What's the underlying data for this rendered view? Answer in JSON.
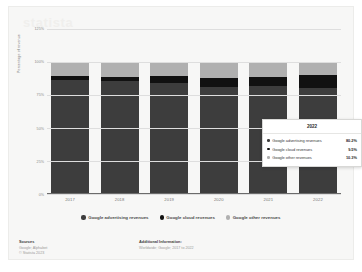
{
  "watermark": "statista",
  "axis": {
    "ylabel": "Percentage of revenue",
    "yticks": [
      "125%",
      "100%",
      "75%",
      "50%",
      "25%",
      "0%"
    ]
  },
  "tooltip": {
    "header": "2022",
    "rows": [
      {
        "label": "Google advertising revenues",
        "value": "80.2%",
        "color": "#3d3d3d"
      },
      {
        "label": "Google cloud revenues",
        "value": "9.5%",
        "color": "#111111"
      },
      {
        "label": "Google other revenues",
        "value": "10.3%",
        "color": "#b0b0b0"
      }
    ]
  },
  "legend": {
    "items": [
      {
        "label": "Google advertising revenues",
        "color": "#3d3d3d"
      },
      {
        "label": "Google cloud revenues",
        "color": "#111111"
      },
      {
        "label": "Google other revenues",
        "color": "#b0b0b0"
      }
    ]
  },
  "footer": {
    "sources_title": "Sources",
    "sources_line1": "Google; Alphabet",
    "sources_line2": "© Statista 2023",
    "additional_title": "Additional Information:",
    "additional_line1": "Worldwide; Google; 2017 to 2022"
  },
  "corner": "",
  "chart_data": {
    "type": "bar",
    "title": "",
    "xlabel": "",
    "ylabel": "Percentage of revenue",
    "ylim": [
      0,
      125
    ],
    "grid": true,
    "legend_position": "bottom",
    "stacked": true,
    "categories": [
      "2017",
      "2018",
      "2019",
      "2020",
      "2021",
      "2022"
    ],
    "series": [
      {
        "name": "Google advertising revenues",
        "color": "#3d3d3d",
        "values": [
          86.1,
          85.2,
          83.9,
          80.8,
          81.3,
          80.2
        ]
      },
      {
        "name": "Google cloud revenues",
        "color": "#111111",
        "values": [
          2.8,
          3.4,
          5.5,
          7.1,
          7.5,
          9.5
        ]
      },
      {
        "name": "Google other revenues",
        "color": "#b0b0b0",
        "values": [
          11.1,
          11.4,
          10.6,
          12.1,
          11.2,
          10.3
        ]
      }
    ]
  }
}
